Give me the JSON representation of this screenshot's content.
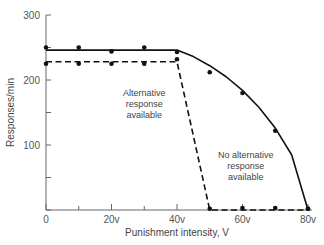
{
  "chart_data": {
    "type": "line",
    "title": "",
    "xlabel": "Punishment intensity, V",
    "ylabel": "Responses/min",
    "xlim": [
      0,
      80
    ],
    "ylim": [
      0,
      300
    ],
    "x_ticks": [
      {
        "value": 0,
        "label": "0"
      },
      {
        "value": 10,
        "label": ""
      },
      {
        "value": 20,
        "label": "20v"
      },
      {
        "value": 30,
        "label": ""
      },
      {
        "value": 40,
        "label": "40v"
      },
      {
        "value": 50,
        "label": ""
      },
      {
        "value": 60,
        "label": "60v"
      },
      {
        "value": 70,
        "label": ""
      },
      {
        "value": 80,
        "label": "80v"
      }
    ],
    "y_ticks": [
      {
        "value": 0,
        "label": ""
      },
      {
        "value": 50,
        "label": ""
      },
      {
        "value": 100,
        "label": "100"
      },
      {
        "value": 150,
        "label": ""
      },
      {
        "value": 200,
        "label": "200"
      },
      {
        "value": 250,
        "label": ""
      },
      {
        "value": 300,
        "label": "300"
      }
    ],
    "grid": false,
    "legend": "none (inline annotations)",
    "series": [
      {
        "name": "No alternative response available",
        "style": "solid",
        "points": [
          {
            "x": 0,
            "y": 250
          },
          {
            "x": 10,
            "y": 250
          },
          {
            "x": 20,
            "y": 244
          },
          {
            "x": 30,
            "y": 250
          },
          {
            "x": 40,
            "y": 243
          },
          {
            "x": 50,
            "y": 212
          },
          {
            "x": 60,
            "y": 180
          },
          {
            "x": 70,
            "y": 122
          },
          {
            "x": 80,
            "y": 2
          }
        ],
        "fit": [
          {
            "x": 0,
            "y": 246
          },
          {
            "x": 40,
            "y": 246
          },
          {
            "x": 45,
            "y": 236
          },
          {
            "x": 50,
            "y": 222
          },
          {
            "x": 55,
            "y": 205
          },
          {
            "x": 60,
            "y": 184
          },
          {
            "x": 65,
            "y": 158
          },
          {
            "x": 70,
            "y": 126
          },
          {
            "x": 75,
            "y": 85
          },
          {
            "x": 80,
            "y": 0
          }
        ]
      },
      {
        "name": "Alternative response available",
        "style": "dashed",
        "points": [
          {
            "x": 0,
            "y": 225
          },
          {
            "x": 10,
            "y": 225
          },
          {
            "x": 20,
            "y": 225
          },
          {
            "x": 30,
            "y": 225
          },
          {
            "x": 40,
            "y": 232
          },
          {
            "x": 50,
            "y": 2
          },
          {
            "x": 60,
            "y": 3
          },
          {
            "x": 70,
            "y": 3
          },
          {
            "x": 80,
            "y": 2
          }
        ],
        "fit": [
          {
            "x": 0,
            "y": 228
          },
          {
            "x": 40,
            "y": 228
          },
          {
            "x": 50,
            "y": 0
          },
          {
            "x": 80,
            "y": 0
          }
        ]
      }
    ],
    "annotations": [
      {
        "lines": [
          "Alternative",
          "response",
          "available"
        ],
        "x": 30,
        "y": 175
      },
      {
        "lines": [
          "No alternative",
          "response",
          "available"
        ],
        "x": 61,
        "y": 80
      }
    ]
  }
}
